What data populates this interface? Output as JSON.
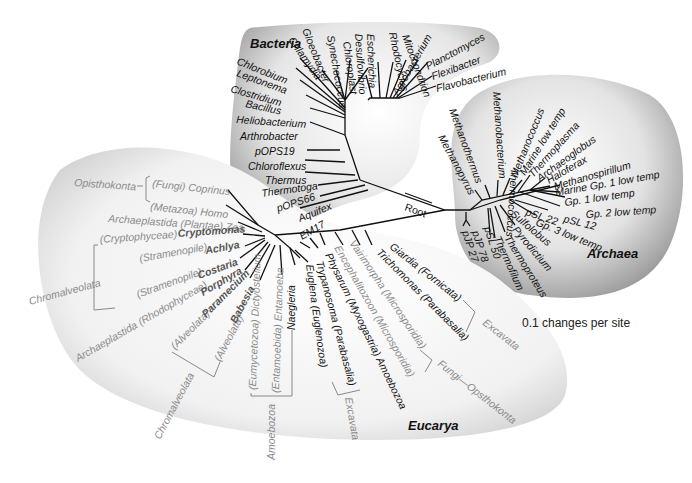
{
  "domains": {
    "bacteria": "Bacteria",
    "archaea": "Archaea",
    "eucarya": "Eucarya"
  },
  "root_label": "Root",
  "scale_label": "0.1 changes per site",
  "bacteria_taxa": [
    "Chlorobium",
    "Leptonema",
    "Clostridium",
    "Bacillus",
    "Heliobacterium",
    "Arthrobacter",
    "pOPS19",
    "Chloroflexus",
    "Thermus",
    "Thermotoga",
    "pOPS66",
    "Aquifex",
    "EM17",
    "Chlamydia",
    "Gloeobacter",
    "Synechococcus",
    "Chloroplast",
    "Desulfovibrio",
    "Escherichia",
    "Rhodocyclus",
    "Mitochondrion",
    "Agrobacterium",
    "Planctomyces",
    "Flexibacter",
    "Flavobacterium"
  ],
  "archaea_taxa": [
    "Methanopyrus",
    "Methanothermus",
    "Methanobacterium",
    "Thermococcus",
    "Methanococcus",
    "Marine low temp",
    "Thermoplasma",
    "Archaeoglobus",
    "Haloferax",
    "Methanospirillum",
    "Marine Gp. 1 low temp",
    "Gp. 1 low temp",
    "Gp. 2 low temp",
    "pSL 12",
    "pSL 22",
    "Gp. 3 low temp",
    "Sulfolobus",
    "Pyrodictium",
    "Thermoproteus",
    "Thermofilum",
    "pSL 50",
    "pJP 78",
    "pJP 27"
  ],
  "eucarya_taxa": {
    "opisthokonta_group": "Opisthokonta",
    "coprinus": "(Fungi) Coprinus",
    "homo": "(Metazoa) Homo",
    "zea": "Archaeplastida (Plantae) Zea",
    "cryptomonas_group": "(Cryptophyceae)",
    "cryptomonas": "Cryptomonas",
    "achlya_group": "(Stramenopile)",
    "achlya": "Achlya",
    "chromalveolata_1": "Chromalveolata",
    "costaria_group": "(Stramenopile)",
    "costaria": "Costaria",
    "porphyra_group": "Archaeplastida (Rhodophyceae)",
    "porphyra": "Porphyra",
    "paramecium_group": "(Alveolata)",
    "paramecium": "Paramecium",
    "babesia_group": "(Alveolata)",
    "babesia": "Babesia",
    "chromalveolata_2": "Chromalveolata",
    "dictyostelium": "(Eumycetozoa) Dictyostelium",
    "entamoeba": "(Entamoebida) Entamoeba",
    "naegleria": "Naegleria",
    "amoebozoa_1": "Amoebozoa",
    "euglena": "Euglena (Euglenozoa)",
    "trypanosoma": "Trypanosoma (Parabasalia)",
    "excavata_1": "Excavata",
    "physarum": "Physarum (Myxogastria) Amoebozoa",
    "encephalitozoon": "Encephalitozoon (Microsporidia)",
    "vairimorpha": "Vairimorpha (Microsporidia)",
    "fungi_opisthokonta": "Fungi—Opsthokonta",
    "trichomonas": "Trichomonas (Parabasalia)",
    "giardia": "Giardia (Fornicata)",
    "excavata_2": "Excavata"
  },
  "colors": {
    "blob_light": "#f6f6f6",
    "blob_mid": "#d9d9d9",
    "blob_dark": "#9a9a9a",
    "branch": "#111111",
    "label_gray": "#8a8a8a"
  }
}
